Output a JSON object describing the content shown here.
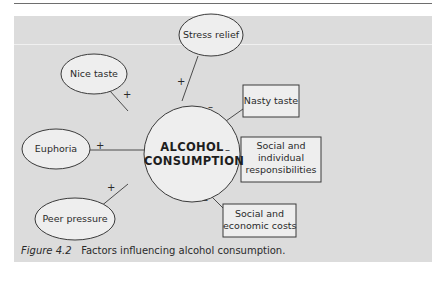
{
  "figure": {
    "caption_label": "Figure 4.2",
    "caption_text": "Factors influencing alcohol consumption."
  },
  "center": {
    "line1": "ALCOHOL",
    "line2": "CONSUMPTION"
  },
  "factors": [
    {
      "id": "stress-relief",
      "label": "Stress relief",
      "shape": "ellipse",
      "sign": "+"
    },
    {
      "id": "nice-taste",
      "label": "Nice taste",
      "shape": "ellipse",
      "sign": "+"
    },
    {
      "id": "euphoria",
      "label": "Euphoria",
      "shape": "ellipse",
      "sign": "+"
    },
    {
      "id": "peer-pressure",
      "label": "Peer pressure",
      "shape": "ellipse",
      "sign": "+"
    },
    {
      "id": "nasty-taste",
      "label": "Nasty taste",
      "shape": "rectangle",
      "sign": "–"
    },
    {
      "id": "social-individual",
      "label_lines": [
        "Social and",
        "individual",
        "responsibilities"
      ],
      "shape": "rectangle",
      "sign": "–"
    },
    {
      "id": "social-economic",
      "label_lines": [
        "Social and",
        "economic costs"
      ],
      "shape": "rectangle",
      "sign": "–"
    }
  ],
  "colors": {
    "panel": "#dcdcdc",
    "node_fill": "#eeeeee",
    "stroke": "#3a3a3a"
  }
}
